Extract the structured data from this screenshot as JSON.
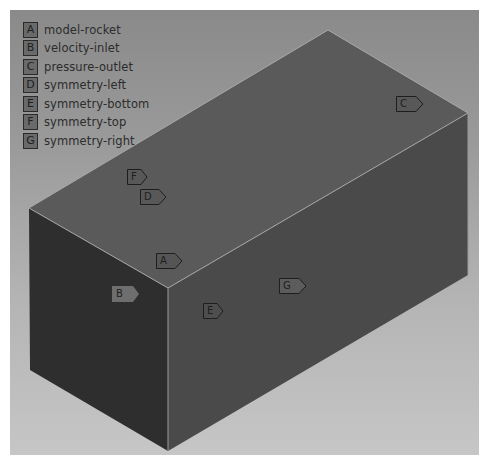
{
  "viewport": {
    "background_top": "#8a8a8a",
    "background_bottom": "#c6c6c6"
  },
  "legend": {
    "items": [
      {
        "key": "A",
        "label": "model-rocket"
      },
      {
        "key": "B",
        "label": "velocity-inlet"
      },
      {
        "key": "C",
        "label": "pressure-outlet"
      },
      {
        "key": "D",
        "label": "symmetry-left"
      },
      {
        "key": "E",
        "label": "symmetry-bottom"
      },
      {
        "key": "F",
        "label": "symmetry-top"
      },
      {
        "key": "G",
        "label": "symmetry-right"
      }
    ]
  },
  "geometry": {
    "colors": {
      "top_face": "#5a5a5a",
      "left_face": "#2e2e2e",
      "right_face": "#4a4a4a",
      "edge": "#a8a8a8"
    }
  },
  "tags": [
    {
      "key": "C",
      "x": 396,
      "y": 96
    },
    {
      "key": "F",
      "x": 127,
      "y": 169
    },
    {
      "key": "D",
      "x": 140,
      "y": 189
    },
    {
      "key": "A",
      "x": 156,
      "y": 253
    },
    {
      "key": "B",
      "x": 112,
      "y": 286,
      "style": "light"
    },
    {
      "key": "G",
      "x": 279,
      "y": 278
    },
    {
      "key": "E",
      "x": 203,
      "y": 303
    }
  ],
  "caption": {
    "text": ""
  }
}
